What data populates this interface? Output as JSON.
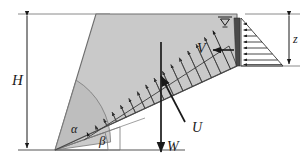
{
  "figure": {
    "background_color": "#ffffff",
    "line_color": "#1a1a1a",
    "wedge_fill_color": "#c9c9c9",
    "wedge_edge_color": "#6e6e6e",
    "crack_fill_color": "#4a4a4a",
    "angle_arc_fill_color": "#b9b9b9"
  },
  "labels": {
    "height": "H",
    "water_depth": "z",
    "weight": "W",
    "uplift": "U",
    "water_thrust": "V",
    "wedge_angle": "α",
    "failure_plane_angle": "β"
  },
  "icons": {
    "water_table": "water-table-symbol",
    "dimension_arrow": "double-headed-arrow"
  },
  "geometry": {
    "toe_point": [
      55,
      150
    ],
    "crest_left": [
      96,
      14
    ],
    "crest_right": [
      237,
      14
    ],
    "crack_bottom": [
      237,
      66
    ],
    "failure_plane_top": [
      237,
      66
    ],
    "ground_line_y": 150,
    "top_line_y": 14,
    "pressure_triangle_apex": [
      283,
      66
    ]
  },
  "forces": {
    "uplift_arrow_count": 16,
    "water_pressure_arrow_count": 8
  }
}
